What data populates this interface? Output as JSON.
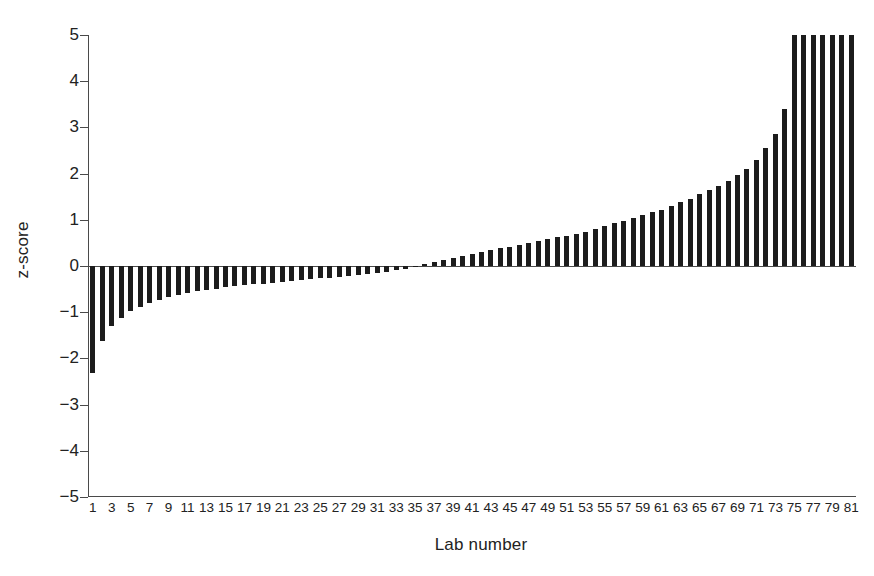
{
  "chart_data": {
    "type": "bar",
    "title": "",
    "subtitle": "",
    "xlabel": "Lab number",
    "ylabel": "z-score",
    "ylim": [
      -5,
      5
    ],
    "xlim": [
      0.5,
      81.5
    ],
    "grid": false,
    "legend": null,
    "legend_position": "none",
    "bar_color": "#1c1c1c",
    "axis_color": "#4a4a4a",
    "background": "#ffffff",
    "note": "Bars sorted ascending by z-score; the final 8 bars are clipped at the top of the axis (values exceed 5).",
    "ytick_labels": [
      "5",
      "4",
      "3",
      "2",
      "1",
      "0",
      "−1",
      "−2",
      "−3",
      "−4",
      "−5"
    ],
    "ytick_values": [
      5,
      4,
      3,
      2,
      1,
      0,
      -1,
      -2,
      -3,
      -4,
      -5
    ],
    "xtick_labels": [
      "1",
      "3",
      "5",
      "7",
      "9",
      "11",
      "13",
      "15",
      "17",
      "19",
      "21",
      "23",
      "25",
      "27",
      "29",
      "31",
      "33",
      "35",
      "37",
      "39",
      "41",
      "43",
      "45",
      "47",
      "49",
      "51",
      "53",
      "55",
      "57",
      "59",
      "61",
      "63",
      "65",
      "67",
      "69",
      "71",
      "73",
      "75",
      "77",
      "79",
      "81"
    ],
    "xtick_values": [
      1,
      3,
      5,
      7,
      9,
      11,
      13,
      15,
      17,
      19,
      21,
      23,
      25,
      27,
      29,
      31,
      33,
      35,
      37,
      39,
      41,
      43,
      45,
      47,
      49,
      51,
      53,
      55,
      57,
      59,
      61,
      63,
      65,
      67,
      69,
      71,
      73,
      75,
      77,
      79,
      81
    ],
    "categories": [
      1,
      2,
      3,
      4,
      5,
      6,
      7,
      8,
      9,
      10,
      11,
      12,
      13,
      14,
      15,
      16,
      17,
      18,
      19,
      20,
      21,
      22,
      23,
      24,
      25,
      26,
      27,
      28,
      29,
      30,
      31,
      32,
      33,
      34,
      35,
      36,
      37,
      38,
      39,
      40,
      41,
      42,
      43,
      44,
      45,
      46,
      47,
      48,
      49,
      50,
      51,
      52,
      53,
      54,
      55,
      56,
      57,
      58,
      59,
      60,
      61,
      62,
      63,
      64,
      65,
      66,
      67,
      68,
      69,
      70,
      71,
      72,
      73,
      74,
      75,
      76,
      77,
      78,
      79,
      80,
      81
    ],
    "values": [
      -2.32,
      -1.63,
      -1.3,
      -1.12,
      -0.98,
      -0.88,
      -0.8,
      -0.73,
      -0.67,
      -0.62,
      -0.58,
      -0.55,
      -0.52,
      -0.49,
      -0.46,
      -0.44,
      -0.42,
      -0.4,
      -0.38,
      -0.36,
      -0.34,
      -0.32,
      -0.3,
      -0.28,
      -0.27,
      -0.25,
      -0.23,
      -0.21,
      -0.19,
      -0.17,
      -0.15,
      -0.12,
      -0.09,
      -0.06,
      -0.03,
      0.04,
      0.08,
      0.12,
      0.18,
      0.22,
      0.26,
      0.3,
      0.34,
      0.38,
      0.42,
      0.46,
      0.5,
      0.54,
      0.58,
      0.62,
      0.66,
      0.7,
      0.74,
      0.8,
      0.86,
      0.92,
      0.98,
      1.04,
      1.1,
      1.16,
      1.22,
      1.3,
      1.38,
      1.46,
      1.55,
      1.64,
      1.74,
      1.84,
      1.96,
      2.1,
      2.3,
      2.55,
      2.85,
      3.4,
      5.1,
      5.1,
      5.1,
      5.1,
      5.1,
      5.1,
      5.1
    ]
  }
}
